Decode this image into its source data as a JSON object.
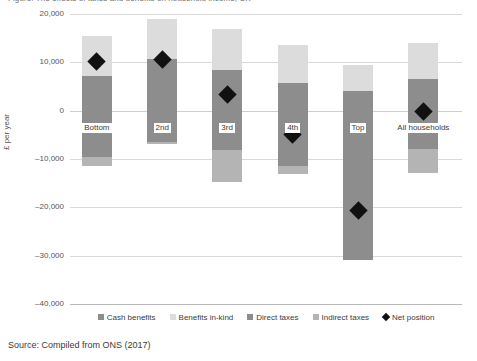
{
  "figure": {
    "title": "Figure: The effects of taxes and benefits on household income, UK",
    "source": "Source: Compiled from ONS (2017)"
  },
  "axes": {
    "ylabel": "£ per year",
    "yticks": [
      "20,000",
      "10,000",
      "0",
      "–10,000",
      "–20,000",
      "–30,000",
      "–40,000"
    ],
    "ytick_values": [
      20000,
      10000,
      0,
      -10000,
      -20000,
      -30000,
      -40000
    ],
    "ylim": [
      -40000,
      20000
    ],
    "grid": true
  },
  "legend": {
    "position": "bottom-center",
    "items": [
      {
        "label": "Cash benefits",
        "color": "#8d8d8d",
        "marker": "square"
      },
      {
        "label": "Benefits in-kind",
        "color": "#dcdcdc",
        "marker": "square"
      },
      {
        "label": "Direct taxes",
        "color": "#8d8d8d",
        "marker": "square"
      },
      {
        "label": "Indirect taxes",
        "color": "#b4b4b4",
        "marker": "square"
      },
      {
        "label": "Net position",
        "color": "#111111",
        "marker": "diamond"
      }
    ]
  },
  "chart_data": {
    "type": "bar",
    "subtype": "stacked-floating-bar-with-marker",
    "title": "The effects of taxes and benefits on household income, UK",
    "xlabel": "",
    "ylabel": "£ per year",
    "ylim": [
      -40000,
      20000
    ],
    "grid": true,
    "categories": [
      "Bottom",
      "2nd",
      "3rd",
      "4th",
      "Top",
      "All households"
    ],
    "series": [
      {
        "name": "Cash benefits",
        "color": "#8d8d8d",
        "values": [
          7200,
          6000,
          4200,
          2600,
          1500,
          4300
        ]
      },
      {
        "name": "Benefits in-kind",
        "color": "#dcdcdc",
        "values": [
          8300,
          13000,
          12800,
          10900,
          8000,
          9700
        ]
      },
      {
        "name": "Direct taxes",
        "color": "#8d8d8d",
        "values": [
          -1300,
          -3200,
          -8200,
          -9500,
          -27700,
          -9800
        ]
      },
      {
        "name": "Indirect taxes",
        "color": "#b4b4b4",
        "values": [
          -4000,
          -3300,
          -6600,
          -6900,
          -3100,
          -4900
        ]
      }
    ],
    "net_position": {
      "name": "Net position",
      "color": "#111111",
      "values": [
        10200,
        10600,
        3400,
        -5000,
        -20600,
        -200
      ]
    }
  },
  "bars": [
    {
      "category": "Bottom",
      "top": 15500,
      "segments": [
        {
          "name": "Benefits in-kind",
          "from": 15500,
          "to": 7200
        },
        {
          "name": "Cash benefits",
          "from": 7200,
          "to": -1300
        },
        {
          "name": "Direct taxes",
          "from": -1300,
          "to": -9500
        },
        {
          "name": "Indirect taxes",
          "from": -9500,
          "to": -11500
        }
      ],
      "net": 10200
    },
    {
      "category": "2nd",
      "top": 19000,
      "segments": [
        {
          "name": "Benefits in-kind",
          "from": 19000,
          "to": 10600
        },
        {
          "name": "Cash benefits",
          "from": 10600,
          "to": -4000
        },
        {
          "name": "Direct taxes",
          "from": -4000,
          "to": -6500
        },
        {
          "name": "Indirect taxes",
          "from": -6500,
          "to": -7000
        }
      ],
      "net": 10600
    },
    {
      "category": "3rd",
      "top": 17000,
      "segments": [
        {
          "name": "Benefits in-kind",
          "from": 17000,
          "to": 8500
        },
        {
          "name": "Cash benefits",
          "from": 8500,
          "to": -300
        },
        {
          "name": "Direct taxes",
          "from": -300,
          "to": -8200
        },
        {
          "name": "Indirect taxes",
          "from": -8200,
          "to": -14800
        }
      ],
      "net": 3400
    },
    {
      "category": "4th",
      "top": 13500,
      "segments": [
        {
          "name": "Benefits in-kind",
          "from": 13500,
          "to": 5800
        },
        {
          "name": "Cash benefits",
          "from": 5800,
          "to": -600
        },
        {
          "name": "Direct taxes",
          "from": -600,
          "to": -11500
        },
        {
          "name": "Indirect taxes",
          "from": -11500,
          "to": -13000
        }
      ],
      "net": -5000
    },
    {
      "category": "Top",
      "top": 9500,
      "segments": [
        {
          "name": "Benefits in-kind",
          "from": 9500,
          "to": 4000
        },
        {
          "name": "Cash benefits",
          "from": 4000,
          "to": 1800
        },
        {
          "name": "Direct taxes",
          "from": 1800,
          "to": -30800
        },
        {
          "name": "Indirect taxes",
          "from": -30800,
          "to": -30900
        }
      ],
      "net": -20600
    },
    {
      "category": "All households",
      "top": 14000,
      "segments": [
        {
          "name": "Benefits in-kind",
          "from": 14000,
          "to": 6500
        },
        {
          "name": "Cash benefits",
          "from": 6500,
          "to": -1800
        },
        {
          "name": "Direct taxes",
          "from": -1800,
          "to": -8000
        },
        {
          "name": "Indirect taxes",
          "from": -8000,
          "to": -13000
        }
      ],
      "net": -200
    }
  ]
}
